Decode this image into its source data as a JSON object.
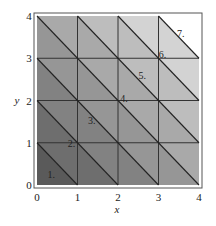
{
  "diagram": {
    "title": "",
    "axes": {
      "xlabel": "x",
      "ylabel": "y",
      "x_ticks": [
        "0",
        "1",
        "2",
        "3",
        "4"
      ],
      "y_ticks": [
        "0",
        "1",
        "2",
        "3",
        "4"
      ],
      "xlim": [
        0,
        4
      ],
      "ylim": [
        0,
        4
      ]
    },
    "grid": {
      "rows": 4,
      "cols": 4,
      "gridlines": [
        1,
        2,
        3
      ]
    },
    "diagonals": [
      {
        "k": 1,
        "label": "1.",
        "label_pos": [
          0.35,
          0.25
        ]
      },
      {
        "k": 2,
        "label": "2.",
        "label_pos": [
          0.85,
          1.0
        ]
      },
      {
        "k": 3,
        "label": "3.",
        "label_pos": [
          1.35,
          1.55
        ]
      },
      {
        "k": 4,
        "label": "4.",
        "label_pos": [
          2.15,
          2.05
        ]
      },
      {
        "k": 5,
        "label": "5.",
        "label_pos": [
          2.6,
          2.6
        ]
      },
      {
        "k": 6,
        "label": "6.",
        "label_pos": [
          3.1,
          3.1
        ]
      },
      {
        "k": 7,
        "label": "7.",
        "label_pos": [
          3.55,
          3.6
        ]
      }
    ],
    "band_colors": [
      "#5a5a5a",
      "#6e6e6e",
      "#828282",
      "#969696",
      "#a9a9a9",
      "#bdbdbd",
      "#d3d3d3",
      "#ffffff"
    ]
  }
}
